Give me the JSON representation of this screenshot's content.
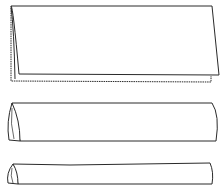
{
  "diagram": {
    "stroke_color": "#2a2a2a",
    "fill_color": "#ffffff",
    "steps": [
      {
        "id": 1,
        "label": "folded-in-half"
      },
      {
        "id": 2,
        "label": "rolled-flat"
      },
      {
        "id": 3,
        "label": "rolled-thin"
      }
    ]
  }
}
